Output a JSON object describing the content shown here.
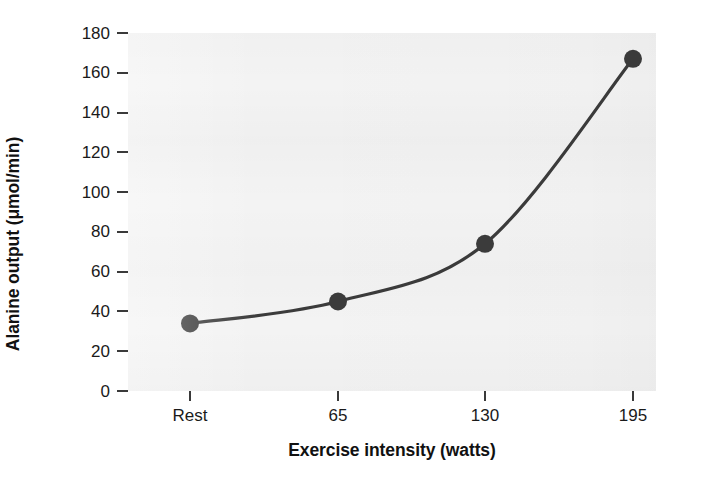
{
  "chart_data": {
    "type": "line",
    "title": "",
    "xlabel": "Exercise intensity (watts)",
    "ylabel": "Alanine output (μmol/min)",
    "categories": [
      "Rest",
      "65",
      "130",
      "195"
    ],
    "x_tick_labels": [
      "Rest",
      "65",
      "130",
      "195"
    ],
    "y_tick_labels": [
      "0",
      "20",
      "40",
      "60",
      "80",
      "100",
      "120",
      "140",
      "160",
      "180"
    ],
    "y_tick_values": [
      0,
      20,
      40,
      60,
      80,
      100,
      120,
      140,
      160,
      180
    ],
    "ylim": [
      0,
      180
    ],
    "values": [
      34,
      45,
      74,
      167
    ],
    "series": [
      {
        "name": "Alanine output",
        "values": [
          34,
          45,
          74,
          167
        ],
        "marker": "filled-circle",
        "color": "#3b3b3b"
      }
    ],
    "points": [
      {
        "x_label": "Rest",
        "y": 34
      },
      {
        "x_label": "65",
        "y": 45
      },
      {
        "x_label": "130",
        "y": 74
      },
      {
        "x_label": "195",
        "y": 167
      }
    ],
    "grid": false,
    "legend": "none",
    "colors": {
      "line": "#3b3b3b",
      "marker": "#3b3b3b",
      "plot_background": "#f3f3f3",
      "figure_background": "#ffffff",
      "tick": "#3a3a3a",
      "text": "#111111"
    }
  }
}
